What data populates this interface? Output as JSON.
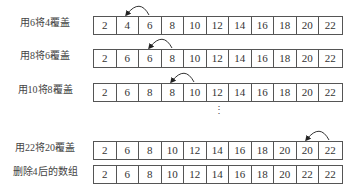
{
  "rows": [
    {
      "label": "用6将4覆盖",
      "cells": [
        "2",
        "4",
        "6",
        "8",
        "10",
        "12",
        "14",
        "16",
        "18",
        "20",
        "22"
      ],
      "arc_from": 2,
      "arc_to": 1
    },
    {
      "label": "用8将6覆盖",
      "cells": [
        "2",
        "6",
        "6",
        "8",
        "10",
        "12",
        "14",
        "16",
        "18",
        "20",
        "22"
      ],
      "arc_from": 3,
      "arc_to": 2
    },
    {
      "label": "用10将8覆盖",
      "cells": [
        "2",
        "6",
        "8",
        "8",
        "10",
        "12",
        "14",
        "16",
        "18",
        "20",
        "22"
      ],
      "arc_from": 4,
      "arc_to": 3
    },
    {
      "label": "用22将20覆盖",
      "cells": [
        "2",
        "6",
        "8",
        "10",
        "12",
        "14",
        "16",
        "18",
        "20",
        "20",
        "22"
      ],
      "arc_from": 10,
      "arc_to": 9
    },
    {
      "label": "删除4后的数组",
      "cells": [
        "2",
        "6",
        "8",
        "10",
        "12",
        "14",
        "16",
        "18",
        "20",
        "22",
        "22"
      ]
    }
  ],
  "ellipsis": "⋮"
}
